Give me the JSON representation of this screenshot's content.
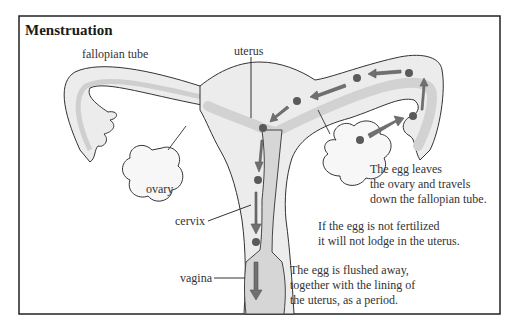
{
  "title": "Menstruation",
  "labels": {
    "fallopian_tube": "fallopian tube",
    "uterus": "uterus",
    "ovary": "ovary",
    "cervix": "cervix",
    "vagina": "vagina"
  },
  "notes": {
    "egg_leaves": [
      "The egg leaves",
      "the ovary and travels",
      "down the fallopian tube."
    ],
    "not_fertilized": [
      "If the egg is not fertilized",
      "it will not lodge in the uterus."
    ],
    "flushed": [
      "The egg is flushed away,",
      "together with the lining of",
      "the uterus, as a period."
    ]
  },
  "colors": {
    "border": "#222222",
    "organ_fill": "#ececec",
    "tube_inner": "#d9d9d9",
    "egg": "#5a5a5a",
    "arrow": "#707070",
    "outline": "#333333"
  }
}
